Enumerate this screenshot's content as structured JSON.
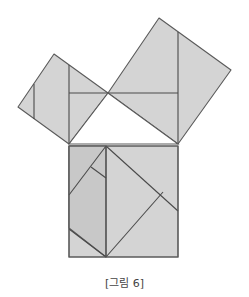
{
  "caption": "[그림 6]",
  "colors": {
    "fill": "#d4d4d4",
    "fill_dark": "#c8c8c8",
    "stroke": "#5a5a5a",
    "background": "#ffffff"
  },
  "diagram": {
    "triangle": {
      "vertices": [
        [
          69,
          144
        ],
        [
          178,
          144
        ],
        [
          108,
          93
        ]
      ]
    },
    "small_square": {
      "vertices": [
        [
          54,
          54
        ],
        [
          108,
          93
        ],
        [
          69,
          144
        ],
        [
          18,
          107
        ]
      ]
    },
    "large_square": {
      "vertices": [
        [
          159,
          18
        ],
        [
          231,
          70
        ],
        [
          178,
          144
        ],
        [
          108,
          93
        ]
      ]
    },
    "hypotenuse_square": {
      "vertices": [
        [
          69,
          144
        ],
        [
          178,
          144
        ],
        [
          178,
          257
        ],
        [
          69,
          257
        ]
      ]
    }
  }
}
